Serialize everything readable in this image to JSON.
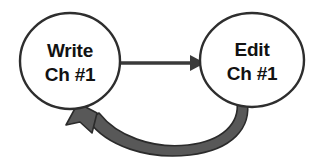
{
  "diagram": {
    "type": "cycle-flow-diagram",
    "background_color": "#ffffff",
    "nodes": [
      {
        "id": "write",
        "name": "write-node",
        "line1": "Write",
        "line2": "Ch #1",
        "shape": "circle",
        "cx": 70,
        "cy": 61,
        "rx": 50,
        "ry": 48,
        "fill": "#ffffff",
        "stroke": "#2e2e2e",
        "stroke_width": 2.4,
        "text_color": "#121212"
      },
      {
        "id": "edit",
        "name": "edit-node",
        "line1": "Edit",
        "line2": "Ch #1",
        "shape": "circle",
        "cx": 252,
        "cy": 60,
        "rx": 52,
        "ry": 47,
        "fill": "#ffffff",
        "stroke": "#2e2e2e",
        "stroke_width": 2.4,
        "text_color": "#121212"
      }
    ],
    "edges": [
      {
        "id": "write-to-edit",
        "name": "arrow-write-to-edit",
        "from": "write",
        "to": "edit",
        "style": "straight",
        "color": "#3a3a3a",
        "stroke_width": 3.2,
        "arrowhead": "solid-triangle",
        "y": 63,
        "x_start": 120,
        "x_end": 200
      },
      {
        "id": "edit-to-write",
        "name": "curved-arrow-edit-to-write",
        "from": "edit",
        "to": "write",
        "style": "curved-tapered-band",
        "fill": "#585858",
        "stroke": "#2b2b2b",
        "stroke_width": 1.6,
        "arrowhead": "filled-triangle",
        "arrowhead_target_x": 78,
        "arrowhead_target_y": 106,
        "band_origin_x": 258,
        "band_origin_y": 104,
        "lowest_y": 155
      }
    ]
  }
}
